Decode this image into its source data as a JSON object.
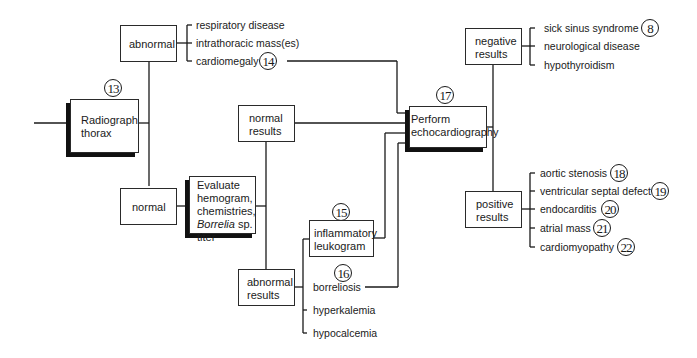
{
  "nodes": {
    "radiograph": {
      "line1": "Radiograph",
      "line2": "thorax",
      "ref": "13"
    },
    "abnormal": {
      "label": "abnormal"
    },
    "normal": {
      "label": "normal"
    },
    "evaluate": {
      "line1": "Evaluate",
      "line2": "hemogram,",
      "line3": "chemistries,",
      "line4_italic": "Borrelia",
      "line4_rest": " sp.",
      "line5": "titer"
    },
    "normal_results": {
      "line1": "normal",
      "line2": "results"
    },
    "abnormal_results": {
      "line1": "abnormal",
      "line2": "results"
    },
    "inflammatory": {
      "line1": "inflammatory",
      "line2": "leukogram",
      "ref": "15"
    },
    "echo": {
      "line1": "Perform",
      "line2": "echocardiography",
      "ref": "17"
    },
    "negative": {
      "line1": "negative",
      "line2": "results"
    },
    "positive": {
      "line1": "positive",
      "line2": "results"
    }
  },
  "abnormal_findings": [
    {
      "label": "respiratory disease"
    },
    {
      "label": "intrathoracic mass(es)"
    },
    {
      "label": "cardiomegaly",
      "ref": "14"
    }
  ],
  "abnormal_results_findings": [
    {
      "label": "borreliosis",
      "ref": "16"
    },
    {
      "label": "hyperkalemia"
    },
    {
      "label": "hypocalcemia"
    }
  ],
  "negative_findings": [
    {
      "label": "sick sinus syndrome",
      "ref": "8"
    },
    {
      "label": "neurological disease"
    },
    {
      "label": "hypothyroidism"
    }
  ],
  "positive_findings": [
    {
      "label": "aortic stenosis",
      "ref": "18"
    },
    {
      "label": "ventricular septal defect",
      "ref": "19"
    },
    {
      "label": "endocarditis",
      "ref": "20"
    },
    {
      "label": "atrial mass",
      "ref": "21"
    },
    {
      "label": "cardiomyopathy",
      "ref": "22"
    }
  ]
}
